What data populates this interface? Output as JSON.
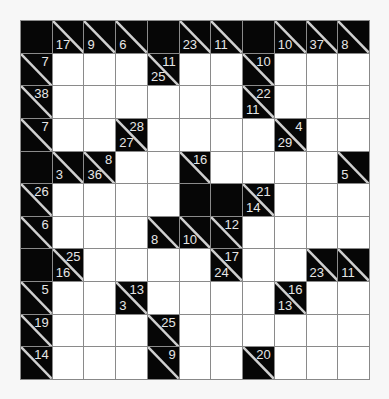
{
  "puzzle": {
    "type": "kakuro",
    "rows": 11,
    "cols": 11,
    "colors": {
      "clue_bg": "#060606",
      "clue_text": "#e6e6e6",
      "grid_line": "#8a8a8a",
      "empty_cell": "#ffffff"
    },
    "legend": "Cell codes: B = solid black, W = white entry cell, clue cells have r (across sum) and/or d (down sum)",
    "grid": [
      [
        {
          "t": "B"
        },
        {
          "t": "C",
          "d": "17"
        },
        {
          "t": "C",
          "d": "9"
        },
        {
          "t": "C",
          "d": "6"
        },
        {
          "t": "B"
        },
        {
          "t": "C",
          "d": "23"
        },
        {
          "t": "C",
          "d": "11"
        },
        {
          "t": "B"
        },
        {
          "t": "C",
          "d": "10"
        },
        {
          "t": "C",
          "d": "37"
        },
        {
          "t": "C",
          "d": "8"
        }
      ],
      [
        {
          "t": "C",
          "r": "7"
        },
        {
          "t": "W"
        },
        {
          "t": "W"
        },
        {
          "t": "W"
        },
        {
          "t": "C",
          "r": "11",
          "d": "25"
        },
        {
          "t": "W"
        },
        {
          "t": "W"
        },
        {
          "t": "C",
          "r": "10"
        },
        {
          "t": "W"
        },
        {
          "t": "W"
        },
        {
          "t": "W"
        }
      ],
      [
        {
          "t": "C",
          "r": "38"
        },
        {
          "t": "W"
        },
        {
          "t": "W"
        },
        {
          "t": "W"
        },
        {
          "t": "W"
        },
        {
          "t": "W"
        },
        {
          "t": "W"
        },
        {
          "t": "C",
          "r": "22",
          "d": "11"
        },
        {
          "t": "W"
        },
        {
          "t": "W"
        },
        {
          "t": "W"
        }
      ],
      [
        {
          "t": "C",
          "r": "7"
        },
        {
          "t": "W"
        },
        {
          "t": "W"
        },
        {
          "t": "C",
          "r": "28",
          "d": "27"
        },
        {
          "t": "W"
        },
        {
          "t": "W"
        },
        {
          "t": "W"
        },
        {
          "t": "W"
        },
        {
          "t": "C",
          "r": "4",
          "d": "29"
        },
        {
          "t": "W"
        },
        {
          "t": "W"
        }
      ],
      [
        {
          "t": "B"
        },
        {
          "t": "C",
          "d": "3"
        },
        {
          "t": "C",
          "r": "8",
          "d": "36"
        },
        {
          "t": "W"
        },
        {
          "t": "W"
        },
        {
          "t": "C",
          "r": "16"
        },
        {
          "t": "W"
        },
        {
          "t": "W"
        },
        {
          "t": "W"
        },
        {
          "t": "W"
        },
        {
          "t": "C",
          "d": "5"
        }
      ],
      [
        {
          "t": "C",
          "r": "26"
        },
        {
          "t": "W"
        },
        {
          "t": "W"
        },
        {
          "t": "W"
        },
        {
          "t": "W"
        },
        {
          "t": "B"
        },
        {
          "t": "B"
        },
        {
          "t": "C",
          "r": "21",
          "d": "14"
        },
        {
          "t": "W"
        },
        {
          "t": "W"
        },
        {
          "t": "W"
        }
      ],
      [
        {
          "t": "C",
          "r": "6"
        },
        {
          "t": "W"
        },
        {
          "t": "W"
        },
        {
          "t": "W"
        },
        {
          "t": "C",
          "d": "8"
        },
        {
          "t": "C",
          "d": "10"
        },
        {
          "t": "C",
          "r": "12"
        },
        {
          "t": "W"
        },
        {
          "t": "W"
        },
        {
          "t": "W"
        },
        {
          "t": "W"
        }
      ],
      [
        {
          "t": "B"
        },
        {
          "t": "C",
          "r": "25",
          "d": "16"
        },
        {
          "t": "W"
        },
        {
          "t": "W"
        },
        {
          "t": "W"
        },
        {
          "t": "W"
        },
        {
          "t": "C",
          "r": "17",
          "d": "24"
        },
        {
          "t": "W"
        },
        {
          "t": "W"
        },
        {
          "t": "C",
          "d": "23"
        },
        {
          "t": "C",
          "d": "11"
        }
      ],
      [
        {
          "t": "C",
          "r": "5"
        },
        {
          "t": "W"
        },
        {
          "t": "W"
        },
        {
          "t": "C",
          "r": "13",
          "d": "3"
        },
        {
          "t": "W"
        },
        {
          "t": "W"
        },
        {
          "t": "W"
        },
        {
          "t": "W"
        },
        {
          "t": "C",
          "r": "16",
          "d": "13"
        },
        {
          "t": "W"
        },
        {
          "t": "W"
        }
      ],
      [
        {
          "t": "C",
          "r": "19"
        },
        {
          "t": "W"
        },
        {
          "t": "W"
        },
        {
          "t": "W"
        },
        {
          "t": "C",
          "r": "25"
        },
        {
          "t": "W"
        },
        {
          "t": "W"
        },
        {
          "t": "W"
        },
        {
          "t": "W"
        },
        {
          "t": "W"
        },
        {
          "t": "W"
        }
      ],
      [
        {
          "t": "C",
          "r": "14"
        },
        {
          "t": "W"
        },
        {
          "t": "W"
        },
        {
          "t": "W"
        },
        {
          "t": "C",
          "r": "9"
        },
        {
          "t": "W"
        },
        {
          "t": "W"
        },
        {
          "t": "C",
          "r": "20"
        },
        {
          "t": "W"
        },
        {
          "t": "W"
        },
        {
          "t": "W"
        }
      ]
    ]
  }
}
